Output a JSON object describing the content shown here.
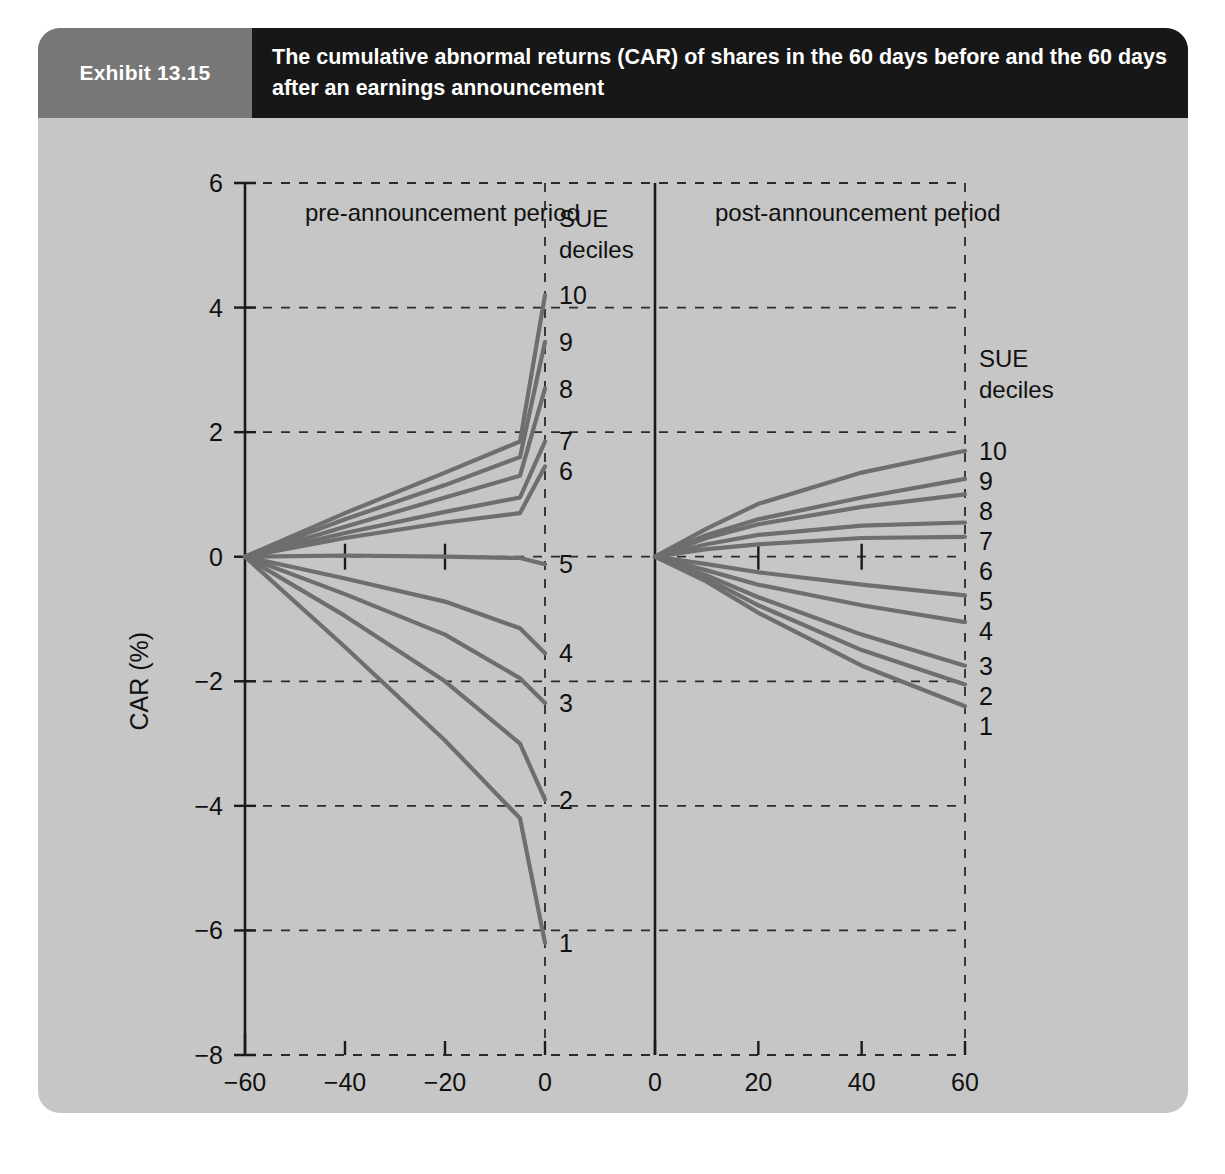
{
  "exhibit": {
    "label": "Exhibit 13.15",
    "title": "The cumulative abnormal returns (CAR) of shares in the 60 days before and the 60 days after an earnings announcement"
  },
  "theme": {
    "panel_background": "#c6c6c6",
    "header_label_background": "#777777",
    "header_title_background": "#171717",
    "header_text": "#ffffff",
    "line_color": "#6e6e6e",
    "grid_color": "#2b2b2b",
    "axis_color": "#1a1a1a",
    "text_color": "#111111"
  },
  "chart_data": {
    "type": "line",
    "title": "The cumulative abnormal returns (CAR) of shares in the 60 days before and the 60 days after an earnings announcement",
    "subtitle": "",
    "xlabel": "event time in trading days relative to earnings announcement day",
    "ylabel": "CAR (%)",
    "ylim": [
      -8,
      6
    ],
    "ytick_labels": [
      "6",
      "4",
      "2",
      "0",
      "−2",
      "−4",
      "−6",
      "−8"
    ],
    "ytick_values": [
      6,
      4,
      2,
      0,
      -2,
      -4,
      -6,
      -8
    ],
    "grid": true,
    "grid_style": "dashed horizontal and panel borders",
    "legend": "inline end-of-line decile labels",
    "legend_position": "right of each panel",
    "legend_title": "SUE deciles",
    "panels": [
      {
        "name": "pre",
        "panel_title": "pre-announcement period",
        "xlabel_ticks": [
          "−60",
          "−40",
          "−20",
          "0"
        ],
        "xtick_values": [
          -60,
          -40,
          -20,
          0
        ],
        "xlim": [
          -60,
          0
        ],
        "legend_title_lines": [
          "SUE",
          "deciles"
        ],
        "series": [
          {
            "name": "10",
            "x": [
              -60,
              -40,
              -20,
              -5,
              0
            ],
            "y": [
              0.0,
              0.7,
              1.35,
              1.85,
              4.2
            ]
          },
          {
            "name": "9",
            "x": [
              -60,
              -40,
              -20,
              -5,
              0
            ],
            "y": [
              0.0,
              0.6,
              1.15,
              1.6,
              3.45
            ]
          },
          {
            "name": "8",
            "x": [
              -60,
              -40,
              -20,
              -5,
              0
            ],
            "y": [
              0.0,
              0.48,
              0.95,
              1.3,
              2.7
            ]
          },
          {
            "name": "7",
            "x": [
              -60,
              -40,
              -20,
              -5,
              0
            ],
            "y": [
              0.0,
              0.38,
              0.72,
              0.95,
              1.85
            ]
          },
          {
            "name": "6",
            "x": [
              -60,
              -40,
              -20,
              -5,
              0
            ],
            "y": [
              0.0,
              0.3,
              0.55,
              0.7,
              1.45
            ]
          },
          {
            "name": "5",
            "x": [
              -60,
              -40,
              -20,
              -5,
              0
            ],
            "y": [
              0.0,
              0.02,
              0.0,
              -0.02,
              -0.12
            ]
          },
          {
            "name": "4",
            "x": [
              -60,
              -40,
              -20,
              -5,
              0
            ],
            "y": [
              0.0,
              -0.35,
              -0.72,
              -1.15,
              -1.55
            ]
          },
          {
            "name": "3",
            "x": [
              -60,
              -40,
              -20,
              -5,
              0
            ],
            "y": [
              0.0,
              -0.6,
              -1.25,
              -1.95,
              -2.35
            ]
          },
          {
            "name": "2",
            "x": [
              -60,
              -40,
              -20,
              -5,
              0
            ],
            "y": [
              0.0,
              -0.95,
              -2.0,
              -3.0,
              -3.9
            ]
          },
          {
            "name": "1",
            "x": [
              -60,
              -40,
              -20,
              -5,
              0
            ],
            "y": [
              0.0,
              -1.45,
              -2.95,
              -4.2,
              -6.2
            ]
          }
        ],
        "end_labels": [
          {
            "name": "10",
            "value": 4.2
          },
          {
            "name": "9",
            "value": 3.45
          },
          {
            "name": "8",
            "value": 2.7
          },
          {
            "name": "7",
            "value": 1.85
          },
          {
            "name": "6",
            "value": 1.45
          },
          {
            "name": "5",
            "value": -0.12
          },
          {
            "name": "4",
            "value": -1.55
          },
          {
            "name": "3",
            "value": -2.35
          },
          {
            "name": "2",
            "value": -3.9
          },
          {
            "name": "1",
            "value": -6.2
          }
        ]
      },
      {
        "name": "post",
        "panel_title": "post-announcement period",
        "xlabel_ticks": [
          "0",
          "20",
          "40",
          "60"
        ],
        "xtick_values": [
          0,
          20,
          40,
          60
        ],
        "xlim": [
          0,
          60
        ],
        "legend_title_lines": [
          "SUE",
          "deciles"
        ],
        "series": [
          {
            "name": "10",
            "x": [
              0,
              10,
              20,
              40,
              60
            ],
            "y": [
              0.0,
              0.45,
              0.85,
              1.35,
              1.7
            ]
          },
          {
            "name": "9",
            "x": [
              0,
              10,
              20,
              40,
              60
            ],
            "y": [
              0.0,
              0.35,
              0.6,
              0.95,
              1.25
            ]
          },
          {
            "name": "8",
            "x": [
              0,
              10,
              20,
              40,
              60
            ],
            "y": [
              0.0,
              0.3,
              0.52,
              0.8,
              1.0
            ]
          },
          {
            "name": "7",
            "x": [
              0,
              10,
              20,
              40,
              60
            ],
            "y": [
              0.0,
              0.2,
              0.35,
              0.5,
              0.55
            ]
          },
          {
            "name": "6",
            "x": [
              0,
              10,
              20,
              40,
              60
            ],
            "y": [
              0.0,
              0.12,
              0.2,
              0.3,
              0.32
            ]
          },
          {
            "name": "5",
            "x": [
              0,
              10,
              20,
              40,
              60
            ],
            "y": [
              0.0,
              -0.12,
              -0.25,
              -0.45,
              -0.62
            ]
          },
          {
            "name": "4",
            "x": [
              0,
              10,
              20,
              40,
              60
            ],
            "y": [
              0.0,
              -0.22,
              -0.45,
              -0.78,
              -1.05
            ]
          },
          {
            "name": "3",
            "x": [
              0,
              10,
              20,
              40,
              60
            ],
            "y": [
              0.0,
              -0.3,
              -0.65,
              -1.25,
              -1.75
            ]
          },
          {
            "name": "2",
            "x": [
              0,
              10,
              20,
              40,
              60
            ],
            "y": [
              0.0,
              -0.35,
              -0.78,
              -1.5,
              -2.05
            ]
          },
          {
            "name": "1",
            "x": [
              0,
              10,
              20,
              40,
              60
            ],
            "y": [
              0.0,
              -0.4,
              -0.9,
              -1.75,
              -2.4
            ]
          }
        ],
        "end_labels": [
          {
            "name": "10",
            "value": 1.7
          },
          {
            "name": "9",
            "value": 1.25
          },
          {
            "name": "8",
            "value": 1.0
          },
          {
            "name": "7",
            "value": 0.55
          },
          {
            "name": "6",
            "value": 0.32
          },
          {
            "name": "5",
            "value": -0.62
          },
          {
            "name": "4",
            "value": -1.05
          },
          {
            "name": "3",
            "value": -1.75
          },
          {
            "name": "2",
            "value": -2.05
          },
          {
            "name": "1",
            "value": -2.4
          }
        ]
      }
    ]
  }
}
